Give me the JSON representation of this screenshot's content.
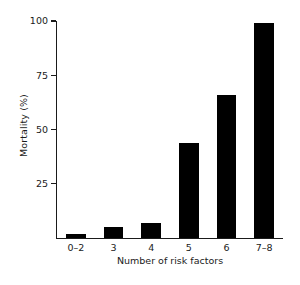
{
  "chart_data": {
    "type": "bar",
    "title": "",
    "xlabel": "Number of risk factors",
    "ylabel": "Mortality (%)",
    "categories": [
      "0–2",
      "3",
      "4",
      "5",
      "6",
      "7–8"
    ],
    "values": [
      2,
      5,
      7,
      44,
      66,
      99
    ],
    "ylim": [
      0,
      100
    ],
    "yticks": [
      25,
      50,
      75,
      100
    ],
    "ytick_labels": [
      "25",
      "50",
      "75",
      "100"
    ],
    "grid": false,
    "legend": null,
    "bar_color": "#000000",
    "axis_color": "#1a1a1a",
    "background": "#ffffff"
  },
  "caption": {
    "clipped_line": " "
  }
}
